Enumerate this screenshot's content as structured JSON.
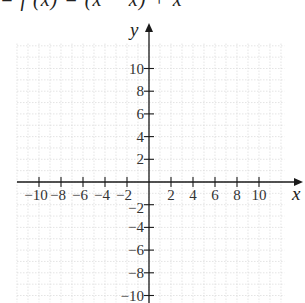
{
  "header": {
    "equation_fragment": "= f (x)  =  (x  −   x)   +   x"
  },
  "chart_data": {
    "type": "line",
    "title": "",
    "xlabel": "x",
    "ylabel": "y",
    "xlim": [
      -10,
      10
    ],
    "ylim": [
      -10,
      10
    ],
    "grid": true,
    "grid_style": "dotted light gray",
    "x_ticks": [
      -10,
      -8,
      -6,
      -4,
      -2,
      2,
      4,
      6,
      8,
      10
    ],
    "y_ticks": [
      -10,
      -8,
      -6,
      -4,
      -2,
      2,
      4,
      6,
      8,
      10
    ],
    "x_tick_labels": [
      "−10",
      "−8",
      "−6",
      "−4",
      "−2",
      "2",
      "4",
      "6",
      "8",
      "10"
    ],
    "y_tick_labels": [
      "−10",
      "−8",
      "−6",
      "−4",
      "−2",
      "2",
      "4",
      "6",
      "8",
      "10"
    ],
    "series": []
  },
  "colors": {
    "axis": "#1a1a1a",
    "grid": "#d8d8d8",
    "text": "#333333"
  }
}
